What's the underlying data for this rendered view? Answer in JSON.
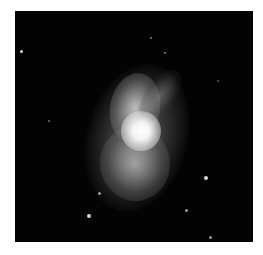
{
  "image": {
    "subject": "nebula",
    "colors": {
      "background": "#030303",
      "border": "#ffffff",
      "core": "#ffffff"
    },
    "stars": [
      {
        "x": 6,
        "y": 40,
        "r": 1.5
      },
      {
        "x": 136,
        "y": 27,
        "r": 1
      },
      {
        "x": 150,
        "y": 42,
        "r": 1
      },
      {
        "x": 205,
        "y": 169,
        "r": 2
      },
      {
        "x": 74,
        "y": 205,
        "r": 2
      },
      {
        "x": 85,
        "y": 183,
        "r": 1.3
      },
      {
        "x": 172,
        "y": 200,
        "r": 1.3
      },
      {
        "x": 196,
        "y": 227,
        "r": 1.3
      },
      {
        "x": 34,
        "y": 110,
        "r": 1
      },
      {
        "x": 203,
        "y": 70,
        "r": 0.8
      },
      {
        "x": 58,
        "y": 120,
        "r": 0.8
      }
    ]
  }
}
